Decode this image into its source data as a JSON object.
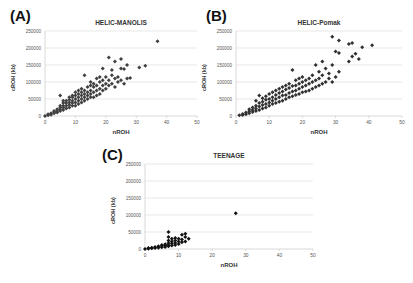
{
  "chart_data": [
    {
      "panel": "(A)",
      "type": "scatter",
      "title": "HELIC-MANOLIS",
      "xlabel": "nROH",
      "ylabel": "cROH (kb)",
      "xlim": [
        0,
        50
      ],
      "ylim": [
        0,
        250000
      ],
      "xticks": [
        0,
        10,
        20,
        30,
        40,
        50
      ],
      "yticks": [
        0,
        50000,
        100000,
        150000,
        200000,
        250000
      ],
      "grid": "horizontal",
      "legend": "none",
      "marker": "diamond",
      "marker_color": "#404040",
      "points": [
        [
          0,
          0
        ],
        [
          1,
          2000
        ],
        [
          1,
          5000
        ],
        [
          2,
          4000
        ],
        [
          2,
          8000
        ],
        [
          3,
          8000
        ],
        [
          3,
          12000
        ],
        [
          3,
          15000
        ],
        [
          4,
          10000
        ],
        [
          4,
          15000
        ],
        [
          4,
          20000
        ],
        [
          5,
          15000
        ],
        [
          5,
          20000
        ],
        [
          5,
          25000
        ],
        [
          5,
          30000
        ],
        [
          5,
          60000
        ],
        [
          6,
          18000
        ],
        [
          6,
          25000
        ],
        [
          6,
          30000
        ],
        [
          6,
          38000
        ],
        [
          6,
          45000
        ],
        [
          7,
          22000
        ],
        [
          7,
          30000
        ],
        [
          7,
          38000
        ],
        [
          7,
          45000
        ],
        [
          8,
          25000
        ],
        [
          8,
          32000
        ],
        [
          8,
          40000
        ],
        [
          8,
          48000
        ],
        [
          8,
          55000
        ],
        [
          9,
          30000
        ],
        [
          9,
          38000
        ],
        [
          9,
          45000
        ],
        [
          9,
          55000
        ],
        [
          9,
          60000
        ],
        [
          10,
          30000
        ],
        [
          10,
          40000
        ],
        [
          10,
          50000
        ],
        [
          10,
          60000
        ],
        [
          10,
          70000
        ],
        [
          11,
          35000
        ],
        [
          11,
          45000
        ],
        [
          11,
          55000
        ],
        [
          11,
          65000
        ],
        [
          11,
          75000
        ],
        [
          12,
          40000
        ],
        [
          12,
          50000
        ],
        [
          12,
          60000
        ],
        [
          12,
          70000
        ],
        [
          12,
          80000
        ],
        [
          13,
          45000
        ],
        [
          13,
          55000
        ],
        [
          13,
          65000
        ],
        [
          13,
          75000
        ],
        [
          13,
          120000
        ],
        [
          14,
          50000
        ],
        [
          14,
          60000
        ],
        [
          14,
          70000
        ],
        [
          14,
          85000
        ],
        [
          15,
          55000
        ],
        [
          15,
          65000
        ],
        [
          15,
          75000
        ],
        [
          15,
          90000
        ],
        [
          15,
          100000
        ],
        [
          16,
          55000
        ],
        [
          16,
          70000
        ],
        [
          16,
          85000
        ],
        [
          16,
          95000
        ],
        [
          17,
          60000
        ],
        [
          17,
          75000
        ],
        [
          17,
          90000
        ],
        [
          17,
          110000
        ],
        [
          18,
          65000
        ],
        [
          18,
          80000
        ],
        [
          18,
          100000
        ],
        [
          18,
          115000
        ],
        [
          19,
          75000
        ],
        [
          19,
          90000
        ],
        [
          19,
          105000
        ],
        [
          19,
          140000
        ],
        [
          20,
          80000
        ],
        [
          20,
          95000
        ],
        [
          20,
          115000
        ],
        [
          21,
          90000
        ],
        [
          21,
          105000
        ],
        [
          21,
          172000
        ],
        [
          22,
          95000
        ],
        [
          22,
          120000
        ],
        [
          22,
          135000
        ],
        [
          23,
          85000
        ],
        [
          23,
          110000
        ],
        [
          23,
          160000
        ],
        [
          24,
          100000
        ],
        [
          24,
          115000
        ],
        [
          25,
          105000
        ],
        [
          25,
          140000
        ],
        [
          25,
          168000
        ],
        [
          26,
          95000
        ],
        [
          26,
          138000
        ],
        [
          27,
          110000
        ],
        [
          27,
          150000
        ],
        [
          28,
          112000
        ],
        [
          31,
          143000
        ],
        [
          33,
          148000
        ],
        [
          37,
          220000
        ]
      ]
    },
    {
      "panel": "(B)",
      "type": "scatter",
      "title": "HELIC-Pomak",
      "xlabel": "nROH",
      "ylabel": "cROH (kb)",
      "xlim": [
        0,
        50
      ],
      "ylim": [
        0,
        250000
      ],
      "xticks": [
        0,
        10,
        20,
        30,
        40,
        50
      ],
      "yticks": [
        0,
        50000,
        100000,
        150000,
        200000,
        250000
      ],
      "grid": "horizontal",
      "legend": "none",
      "marker": "diamond",
      "marker_color": "#303030",
      "points": [
        [
          1,
          2000
        ],
        [
          2,
          3000
        ],
        [
          2,
          6000
        ],
        [
          3,
          5000
        ],
        [
          3,
          10000
        ],
        [
          4,
          8000
        ],
        [
          4,
          14000
        ],
        [
          4,
          20000
        ],
        [
          5,
          12000
        ],
        [
          5,
          18000
        ],
        [
          5,
          25000
        ],
        [
          6,
          15000
        ],
        [
          6,
          22000
        ],
        [
          6,
          30000
        ],
        [
          6,
          45000
        ],
        [
          7,
          18000
        ],
        [
          7,
          28000
        ],
        [
          7,
          38000
        ],
        [
          7,
          60000
        ],
        [
          8,
          22000
        ],
        [
          8,
          32000
        ],
        [
          8,
          42000
        ],
        [
          8,
          52000
        ],
        [
          9,
          25000
        ],
        [
          9,
          35000
        ],
        [
          9,
          48000
        ],
        [
          9,
          58000
        ],
        [
          10,
          30000
        ],
        [
          10,
          40000
        ],
        [
          10,
          50000
        ],
        [
          10,
          65000
        ],
        [
          11,
          35000
        ],
        [
          11,
          45000
        ],
        [
          11,
          55000
        ],
        [
          11,
          70000
        ],
        [
          12,
          38000
        ],
        [
          12,
          50000
        ],
        [
          12,
          62000
        ],
        [
          12,
          75000
        ],
        [
          13,
          42000
        ],
        [
          13,
          55000
        ],
        [
          13,
          68000
        ],
        [
          13,
          80000
        ],
        [
          14,
          45000
        ],
        [
          14,
          60000
        ],
        [
          14,
          72000
        ],
        [
          14,
          85000
        ],
        [
          15,
          50000
        ],
        [
          15,
          62000
        ],
        [
          15,
          78000
        ],
        [
          15,
          90000
        ],
        [
          16,
          55000
        ],
        [
          16,
          68000
        ],
        [
          16,
          82000
        ],
        [
          16,
          95000
        ],
        [
          17,
          58000
        ],
        [
          17,
          72000
        ],
        [
          17,
          88000
        ],
        [
          17,
          135000
        ],
        [
          18,
          62000
        ],
        [
          18,
          75000
        ],
        [
          18,
          90000
        ],
        [
          18,
          105000
        ],
        [
          19,
          65000
        ],
        [
          19,
          80000
        ],
        [
          19,
          95000
        ],
        [
          19,
          110000
        ],
        [
          20,
          70000
        ],
        [
          20,
          85000
        ],
        [
          20,
          100000
        ],
        [
          20,
          115000
        ],
        [
          21,
          72000
        ],
        [
          21,
          90000
        ],
        [
          21,
          105000
        ],
        [
          22,
          75000
        ],
        [
          22,
          95000
        ],
        [
          22,
          110000
        ],
        [
          23,
          80000
        ],
        [
          23,
          100000
        ],
        [
          23,
          120000
        ],
        [
          24,
          85000
        ],
        [
          24,
          105000
        ],
        [
          24,
          150000
        ],
        [
          25,
          90000
        ],
        [
          25,
          110000
        ],
        [
          25,
          130000
        ],
        [
          26,
          95000
        ],
        [
          26,
          120000
        ],
        [
          26,
          160000
        ],
        [
          27,
          100000
        ],
        [
          27,
          140000
        ],
        [
          28,
          110000
        ],
        [
          28,
          125000
        ],
        [
          29,
          100000
        ],
        [
          29,
          150000
        ],
        [
          29,
          233000
        ],
        [
          30,
          115000
        ],
        [
          30,
          190000
        ],
        [
          31,
          130000
        ],
        [
          31,
          185000
        ],
        [
          31,
          222000
        ],
        [
          34,
          160000
        ],
        [
          34,
          212000
        ],
        [
          35,
          175000
        ],
        [
          35,
          215000
        ],
        [
          36,
          183000
        ],
        [
          37,
          168000
        ],
        [
          38,
          202000
        ],
        [
          41,
          208000
        ]
      ]
    },
    {
      "panel": "(C)",
      "type": "scatter",
      "title": "TEENAGE",
      "xlabel": "nROH",
      "ylabel": "cROH (kb)",
      "xlim": [
        0,
        50
      ],
      "ylim": [
        0,
        250000
      ],
      "xticks": [
        0,
        10,
        20,
        30,
        40,
        50
      ],
      "yticks": [
        0,
        50000,
        100000,
        150000,
        200000,
        250000
      ],
      "grid": "horizontal",
      "legend": "none",
      "marker": "diamond",
      "marker_color": "#111111",
      "points": [
        [
          0,
          0
        ],
        [
          1,
          1000
        ],
        [
          1,
          3000
        ],
        [
          2,
          2000
        ],
        [
          2,
          4000
        ],
        [
          3,
          3000
        ],
        [
          3,
          6000
        ],
        [
          4,
          4000
        ],
        [
          4,
          8000
        ],
        [
          5,
          5000
        ],
        [
          5,
          9000
        ],
        [
          5,
          12000
        ],
        [
          6,
          6000
        ],
        [
          6,
          10000
        ],
        [
          6,
          14000
        ],
        [
          7,
          8000
        ],
        [
          7,
          12000
        ],
        [
          7,
          18000
        ],
        [
          7,
          25000
        ],
        [
          7,
          35000
        ],
        [
          7,
          50000
        ],
        [
          8,
          10000
        ],
        [
          8,
          16000
        ],
        [
          8,
          22000
        ],
        [
          8,
          30000
        ],
        [
          9,
          12000
        ],
        [
          9,
          18000
        ],
        [
          9,
          25000
        ],
        [
          9,
          32000
        ],
        [
          10,
          15000
        ],
        [
          10,
          22000
        ],
        [
          10,
          30000
        ],
        [
          11,
          20000
        ],
        [
          11,
          28000
        ],
        [
          11,
          42000
        ],
        [
          12,
          22000
        ],
        [
          12,
          35000
        ],
        [
          12,
          45000
        ],
        [
          13,
          30000
        ],
        [
          27,
          105000
        ]
      ]
    }
  ],
  "panels": {
    "a": {
      "letter": "(A)",
      "title": "HELIC-MANOLIS",
      "xlabel": "nROH",
      "ylabel": "cROH (kb)"
    },
    "b": {
      "letter": "(B)",
      "title": "HELIC-Pomak",
      "xlabel": "nROH",
      "ylabel": "cROH (kb)"
    },
    "c": {
      "letter": "(C)",
      "title": "TEENAGE",
      "xlabel": "nROH",
      "ylabel": "cROH (kb)"
    }
  },
  "colors": {
    "gridline": "#d9d9d9",
    "axis": "#bfbfbf",
    "tick_text": "#555555",
    "label_text": "#333333"
  }
}
